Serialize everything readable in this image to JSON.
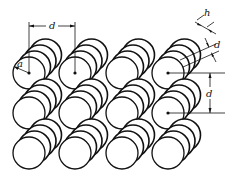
{
  "diagram": {
    "columns": 4,
    "rows": 3,
    "stack_depth": 4,
    "labels": {
      "pitch_top": "d",
      "radius": "a",
      "thickness": "h",
      "stack_spacing": "d",
      "row_pitch": "d"
    },
    "colors": {
      "stroke": "#111111",
      "fill": "#ffffff"
    }
  }
}
